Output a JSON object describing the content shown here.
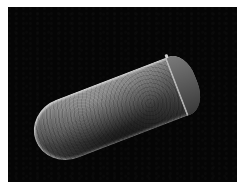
{
  "image": {
    "description": "Grayscale scanning electron micrograph of an elongated, capsule-shaped specimen with textured surface and a cap-like ring at one end, on a black background",
    "colors": {
      "background": "#050505",
      "border": "#ffffff",
      "specimen_highlight": "#cfcfcf",
      "specimen_shadow": "#2a2a2a"
    }
  }
}
